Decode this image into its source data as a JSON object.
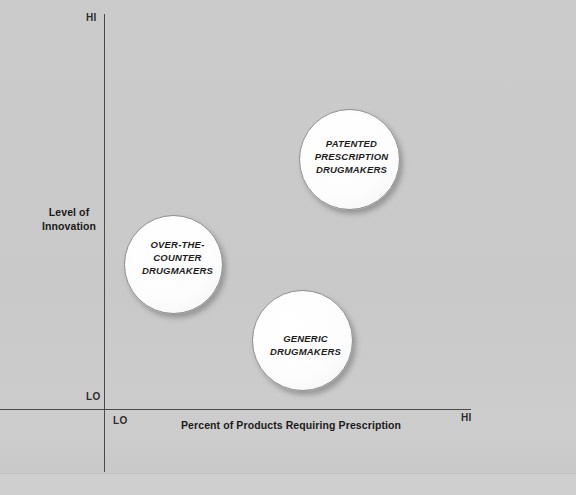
{
  "chart_data": {
    "type": "scatter",
    "title": "",
    "xlabel": "Percent of Products Requiring Prescription",
    "ylabel": "Level of Innovation",
    "x_tick_labels": [
      "LO",
      "HI"
    ],
    "y_tick_labels": [
      "LO",
      "HI"
    ],
    "xlim": [
      "LO",
      "HI"
    ],
    "ylim": [
      "LO",
      "HI"
    ],
    "grid": false,
    "legend": "none",
    "bubble_fill": "#ffffff",
    "bubble_border": "#8e8e8e",
    "background": "#cacaca",
    "points": [
      {
        "label": "PATENTED\nPRESCRIPTION\nDRUGMAKERS",
        "x": 0.71,
        "y": 0.76,
        "size": 101
      },
      {
        "label": "OVER-THE-\nCOUNTER\nDRUGMAKERS",
        "x": 0.29,
        "y": 0.49,
        "size": 99
      },
      {
        "label": "GENERIC\nDRUGMAKERS",
        "x": 0.56,
        "y": 0.3,
        "size": 101
      }
    ]
  },
  "axes": {
    "y": {
      "title": "Level of Innovation",
      "hi_label": "HI",
      "lo_label": "LO"
    },
    "x": {
      "title": "Percent of Products Requiring Prescription",
      "hi_label": "HI",
      "lo_label": "LO"
    }
  },
  "bubbles": {
    "patented": "PATENTED\nPRESCRIPTION\nDRUGMAKERS",
    "otc": "OVER-THE-\nCOUNTER\nDRUGMAKERS",
    "generic": "GENERIC\nDRUGMAKERS"
  }
}
